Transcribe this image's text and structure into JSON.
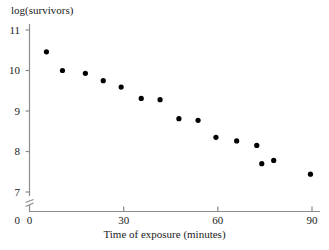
{
  "chart_data": {
    "type": "scatter",
    "title": "",
    "xlabel": "Time of exposure (minutes)",
    "ylabel": "log(survivors)",
    "xlim": [
      0,
      93
    ],
    "ylim": [
      6.85,
      11.25
    ],
    "y_axis_break": true,
    "y_axis_break_symbol": "zigzag",
    "grid": false,
    "legend": null,
    "xticks": [
      0,
      30,
      60,
      90
    ],
    "xtick_labels": [
      "0",
      "30",
      "60",
      "90"
    ],
    "yticks": [
      7,
      8,
      9,
      10,
      11
    ],
    "ytick_labels": [
      "7",
      "8",
      "9",
      "10",
      "11"
    ],
    "y_origin_label": "0",
    "marker": "filled-circle",
    "marker_color": "#000000",
    "marker_size": 4,
    "x": [
      5.4,
      10.5,
      17.8,
      23.5,
      29.2,
      35.6,
      41.6,
      47.6,
      53.7,
      59.4,
      66.0,
      72.4,
      74.0,
      77.8,
      89.5
    ],
    "y": [
      10.46,
      10.0,
      9.93,
      9.75,
      9.59,
      9.31,
      9.28,
      8.81,
      8.77,
      8.35,
      8.26,
      8.15,
      7.7,
      7.78,
      7.44
    ],
    "points": [
      {
        "x": 5.4,
        "y": 10.46
      },
      {
        "x": 10.5,
        "y": 10.0
      },
      {
        "x": 17.8,
        "y": 9.93
      },
      {
        "x": 23.5,
        "y": 9.75
      },
      {
        "x": 29.2,
        "y": 9.59
      },
      {
        "x": 35.6,
        "y": 9.31
      },
      {
        "x": 41.6,
        "y": 9.28
      },
      {
        "x": 47.6,
        "y": 8.81
      },
      {
        "x": 53.7,
        "y": 8.77
      },
      {
        "x": 59.4,
        "y": 8.35
      },
      {
        "x": 66.0,
        "y": 8.26
      },
      {
        "x": 72.4,
        "y": 8.15
      },
      {
        "x": 74.0,
        "y": 7.7
      },
      {
        "x": 77.8,
        "y": 7.78
      },
      {
        "x": 89.5,
        "y": 7.44
      }
    ],
    "axis_color": "#888888"
  }
}
